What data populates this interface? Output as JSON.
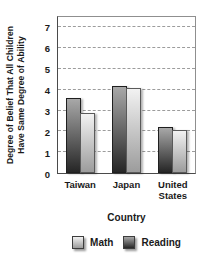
{
  "chart_data": {
    "type": "bar",
    "title": "",
    "ylabel": "Degree of Belief That All Children Have Same Degree of Ability",
    "ylabel_lines": [
      "Degree of Belief That All Children",
      "Have Same Degree of Ability"
    ],
    "xlabel": "Country",
    "categories": [
      "Taiwan",
      "Japan",
      "United States"
    ],
    "series": [
      {
        "name": "Math",
        "values": [
          2.9,
          4.1,
          2.05
        ],
        "color_top": "#f2f2f2",
        "color_bottom": "#9c9c9c",
        "border": "#5a5a5a"
      },
      {
        "name": "Reading",
        "values": [
          3.6,
          4.2,
          2.2
        ],
        "color_top": "#a8a8a8",
        "color_bottom": "#262626",
        "border": "#1f1f1f"
      }
    ],
    "bar_order": [
      "Reading",
      "Math"
    ],
    "legend_order": [
      "Math",
      "Reading"
    ],
    "legend_position": "bottom",
    "grid": "horizontal-dashed",
    "grid_color": "#9c9c9c",
    "ylim": [
      0,
      7.5
    ],
    "yticks": [
      0,
      1,
      2,
      3,
      4,
      5,
      6,
      7
    ]
  }
}
